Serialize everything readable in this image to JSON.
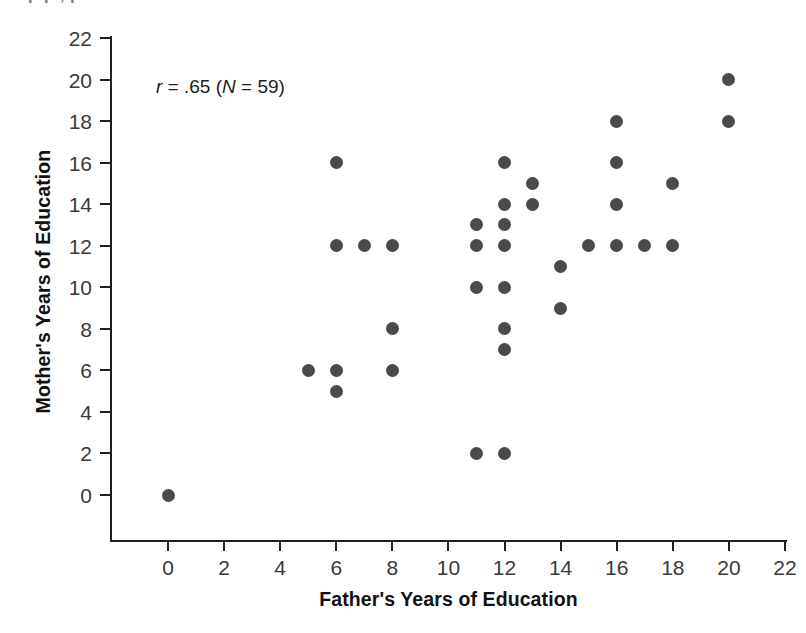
{
  "page": {
    "top_text_fragment": "p        p        ,        p"
  },
  "annotation": {
    "full": "r = .65 (N = 59)",
    "r_symbol": "r",
    "r_value": " = .65 (",
    "n_symbol": "N",
    "n_value": " = 59)"
  },
  "chart_data": {
    "type": "scatter",
    "title": "",
    "xlabel": "Father's Years of Education",
    "ylabel": "Mother's Years of Education",
    "xlim": [
      0,
      22
    ],
    "ylim": [
      0,
      22
    ],
    "xticks": [
      0,
      2,
      4,
      6,
      8,
      10,
      12,
      14,
      16,
      18,
      20,
      22
    ],
    "yticks": [
      0,
      2,
      4,
      6,
      8,
      10,
      12,
      14,
      16,
      18,
      20,
      22
    ],
    "xtick_labels": [
      "0",
      "2",
      "4",
      "6",
      "8",
      "10",
      "12",
      "14",
      "16",
      "18",
      "20",
      "22"
    ],
    "ytick_labels": [
      "0",
      "2",
      "4",
      "6",
      "8",
      "10",
      "12",
      "14",
      "16",
      "18",
      "20",
      "22"
    ],
    "grid": false,
    "legend": false,
    "annotations": [
      {
        "text": "r = .65 (N = 59)",
        "x": 1.6,
        "y": 20.0
      }
    ],
    "marker_color": "#4a4a4a",
    "marker_size": 13,
    "correlation_r": 0.65,
    "n": 59,
    "points": [
      {
        "x": 0,
        "y": 0
      },
      {
        "x": 5,
        "y": 6
      },
      {
        "x": 6,
        "y": 16
      },
      {
        "x": 6,
        "y": 12
      },
      {
        "x": 6,
        "y": 6
      },
      {
        "x": 6,
        "y": 5
      },
      {
        "x": 7,
        "y": 12
      },
      {
        "x": 8,
        "y": 12
      },
      {
        "x": 8,
        "y": 8
      },
      {
        "x": 8,
        "y": 6
      },
      {
        "x": 11,
        "y": 13
      },
      {
        "x": 11,
        "y": 12
      },
      {
        "x": 11,
        "y": 10
      },
      {
        "x": 11,
        "y": 2
      },
      {
        "x": 12,
        "y": 16
      },
      {
        "x": 12,
        "y": 14
      },
      {
        "x": 12,
        "y": 13
      },
      {
        "x": 12,
        "y": 12
      },
      {
        "x": 12,
        "y": 10
      },
      {
        "x": 12,
        "y": 8
      },
      {
        "x": 12,
        "y": 7
      },
      {
        "x": 12,
        "y": 2
      },
      {
        "x": 13,
        "y": 15
      },
      {
        "x": 13,
        "y": 14
      },
      {
        "x": 14,
        "y": 11
      },
      {
        "x": 14,
        "y": 9
      },
      {
        "x": 15,
        "y": 12
      },
      {
        "x": 16,
        "y": 18
      },
      {
        "x": 16,
        "y": 16
      },
      {
        "x": 16,
        "y": 14
      },
      {
        "x": 16,
        "y": 12
      },
      {
        "x": 17,
        "y": 12
      },
      {
        "x": 18,
        "y": 15
      },
      {
        "x": 18,
        "y": 12
      },
      {
        "x": 20,
        "y": 20
      },
      {
        "x": 20,
        "y": 18
      }
    ]
  }
}
